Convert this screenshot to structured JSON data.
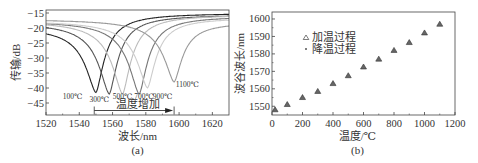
{
  "chart_data": [
    {
      "type": "line",
      "panel": "(a)",
      "title": "",
      "xlabel": "波长/nm",
      "ylabel": "传输/dB",
      "xlim": [
        1520,
        1630
      ],
      "ylim": [
        -49,
        -14
      ],
      "xticks": [
        1520,
        1540,
        1560,
        1580,
        1600,
        1620
      ],
      "yticks": [
        -15,
        -20,
        -25,
        -30,
        -35,
        -40,
        -45
      ],
      "grid": false,
      "annotation": "温度增加",
      "arrow": {
        "from": 1549,
        "to": 1597,
        "y": -47.5
      },
      "series": [
        {
          "name": "100℃",
          "dip_x": 1550,
          "dip_y": -41.5,
          "start_y": -19.5,
          "end_y": -15,
          "color": "#222222",
          "label_x": 1536,
          "label_y": -43.5
        },
        {
          "name": "300℃",
          "dip_x": 1558,
          "dip_y": -42,
          "start_y": -18,
          "end_y": -15.5,
          "color": "#555555",
          "label_x": 1552,
          "label_y": -44.5
        },
        {
          "name": "500℃",
          "dip_x": 1566,
          "dip_y": -42,
          "start_y": -17.5,
          "end_y": -15.5,
          "color": "#bbbbbb",
          "label_x": 1566,
          "label_y": -43.5
        },
        {
          "name": "700℃",
          "dip_x": 1576,
          "dip_y": -42,
          "start_y": -17.5,
          "end_y": -16,
          "color": "#777777",
          "label_x": 1579,
          "label_y": -43.5
        },
        {
          "name": "900℃",
          "dip_x": 1581,
          "dip_y": -40,
          "start_y": -17.5,
          "end_y": -16.5,
          "color": "#cccccc",
          "label_x": 1590,
          "label_y": -43.5
        },
        {
          "name": "1100℃",
          "dip_x": 1597,
          "dip_y": -38,
          "start_y": -17,
          "end_y": -18,
          "color": "#999999",
          "label_x": 1605,
          "label_y": -39.8
        }
      ]
    },
    {
      "type": "scatter",
      "panel": "(b)",
      "title": "",
      "xlabel": "温度/℃",
      "ylabel": "波谷波长/nm",
      "xlim": [
        0,
        1200
      ],
      "ylim": [
        1545,
        1604
      ],
      "xticks": [
        0,
        200,
        400,
        600,
        800,
        1000,
        1200
      ],
      "yticks": [
        1550,
        1560,
        1570,
        1580,
        1590,
        1600
      ],
      "grid": false,
      "legend_position": "upper-left",
      "series": [
        {
          "name": "加温过程",
          "marker": "triangle",
          "x": [
            20,
            100,
            200,
            300,
            400,
            500,
            600,
            700,
            800,
            900,
            1000,
            1100
          ],
          "y": [
            1548,
            1551,
            1555,
            1558.5,
            1563,
            1567.5,
            1572.5,
            1577,
            1582,
            1586.5,
            1592,
            1597
          ]
        },
        {
          "name": "降温过程",
          "marker": "dot",
          "x": [
            20,
            100,
            200,
            300,
            400,
            500,
            600,
            700,
            800,
            900,
            1000,
            1100
          ],
          "y": [
            1548,
            1551,
            1555,
            1558.5,
            1563,
            1567.5,
            1572.5,
            1577,
            1582,
            1586.5,
            1592,
            1597
          ]
        }
      ]
    }
  ],
  "labels": {
    "panel_a": "(a)",
    "panel_b": "(b)"
  }
}
